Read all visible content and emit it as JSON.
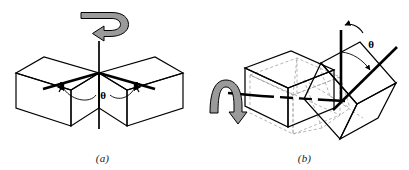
{
  "figure": {
    "background_color": "#ffffff",
    "line_color": "#000000",
    "arrow_fill_color": "#9a9a9a",
    "phantom_line_color": "#9b9b9b"
  },
  "panels": [
    {
      "id": "a",
      "caption": "(a)",
      "description": "Two mirrored isometric boxes meeting at a common corner with a vertical rotation axis",
      "angle_label": "θ",
      "rotation_arrow": "curved-rotation-arrow-top",
      "axis": "vertical-rotation-axis",
      "objects": [
        "left-box",
        "right-box",
        "left-edge-vector",
        "right-edge-vector",
        "angle-arc"
      ]
    },
    {
      "id": "b",
      "caption": "(b)",
      "description": "A box and its rotated copy sharing a horizontal axis, with phantom construction outlines",
      "angle_label": "θ",
      "rotation_arrow": "curved-rotation-arrow-left",
      "axis": "horizontal-rotation-axis",
      "objects": [
        "solid-box",
        "rotated-box",
        "phantom-box",
        "vertical-vector",
        "tilted-vector",
        "angle-arc",
        "top-curved-arrow"
      ]
    }
  ]
}
